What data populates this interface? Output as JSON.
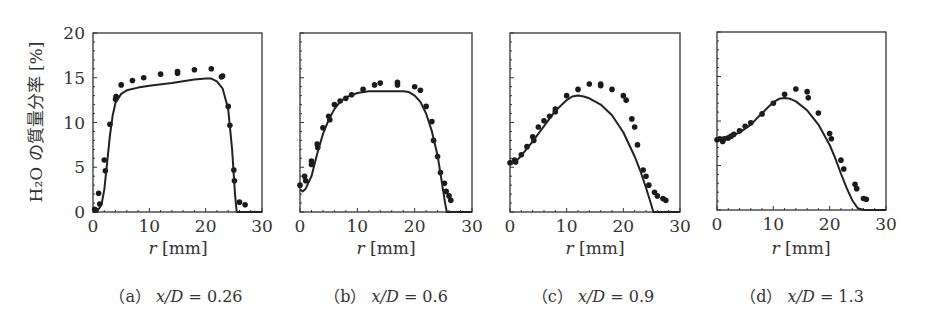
{
  "figure": {
    "ylabel": "H₂O の質量分率 [%]",
    "xlabel_var": "r",
    "xlabel_unit": "[mm]"
  },
  "chart_data": [
    {
      "type": "scatter+line",
      "panel": "(a)",
      "caption_prefix": "（a）",
      "caption_var": "x/D",
      "caption_value": "= 0.26",
      "xlabel": "r [mm]",
      "ylabel": "H2O の質量分率 [%]",
      "xlim": [
        0,
        30
      ],
      "ylim": [
        0,
        20
      ],
      "xticks": [
        0,
        10,
        20,
        30
      ],
      "yticks": [
        0,
        5,
        10,
        15,
        20
      ],
      "series": [
        {
          "name": "measured",
          "style": "markers",
          "points": [
            [
              0.3,
              0.3
            ],
            [
              0.5,
              0.2
            ],
            [
              1,
              2.1
            ],
            [
              1.2,
              0.9
            ],
            [
              2,
              5.8
            ],
            [
              2.2,
              4.6
            ],
            [
              3,
              9.8
            ],
            [
              4,
              12.6
            ],
            [
              4.1,
              12.9
            ],
            [
              5,
              14.2
            ],
            [
              7,
              14.7
            ],
            [
              9,
              15.0
            ],
            [
              12,
              15.4
            ],
            [
              15,
              15.7
            ],
            [
              15,
              15.5
            ],
            [
              18,
              15.9
            ],
            [
              21,
              16.0
            ],
            [
              23,
              15.2
            ],
            [
              22.8,
              15.1
            ],
            [
              24,
              11.8
            ],
            [
              24.3,
              9.7
            ],
            [
              25,
              4.7
            ],
            [
              25.1,
              3.5
            ],
            [
              26,
              1.1
            ],
            [
              27,
              0.8
            ]
          ]
        },
        {
          "name": "computed",
          "style": "line",
          "points": [
            [
              0,
              0
            ],
            [
              1,
              0.3
            ],
            [
              1.5,
              0.8
            ],
            [
              2,
              2.5
            ],
            [
              2.5,
              5.5
            ],
            [
              3,
              8.5
            ],
            [
              3.5,
              10.8
            ],
            [
              4,
              12.2
            ],
            [
              5,
              13.2
            ],
            [
              6,
              13.6
            ],
            [
              8,
              13.9
            ],
            [
              10,
              14.1
            ],
            [
              14,
              14.4
            ],
            [
              18,
              14.8
            ],
            [
              20,
              14.9
            ],
            [
              21,
              14.9
            ],
            [
              22,
              14.6
            ],
            [
              23,
              13.8
            ],
            [
              24,
              11.5
            ],
            [
              24.7,
              7
            ],
            [
              25.2,
              2
            ],
            [
              25.5,
              0
            ],
            [
              30,
              0
            ]
          ]
        }
      ]
    },
    {
      "type": "scatter+line",
      "panel": "(b)",
      "caption_prefix": "（b）",
      "caption_var": "x/D",
      "caption_value": "= 0.6",
      "xlabel": "r [mm]",
      "xlim": [
        0,
        30
      ],
      "ylim": [
        0,
        20
      ],
      "xticks": [
        0,
        10,
        20,
        30
      ],
      "series": [
        {
          "name": "measured",
          "style": "markers",
          "points": [
            [
              0,
              3
            ],
            [
              0.8,
              4
            ],
            [
              1,
              3.5
            ],
            [
              2,
              5.7
            ],
            [
              2,
              5.3
            ],
            [
              3,
              7.6
            ],
            [
              3.1,
              7.2
            ],
            [
              4,
              9.4
            ],
            [
              5,
              10.7
            ],
            [
              5.2,
              10.3
            ],
            [
              6,
              12.0
            ],
            [
              7,
              12.4
            ],
            [
              8,
              12.7
            ],
            [
              9,
              13.1
            ],
            [
              11,
              13.7
            ],
            [
              13,
              14.2
            ],
            [
              14,
              14.4
            ],
            [
              17,
              14.5
            ],
            [
              17,
              14.2
            ],
            [
              20,
              14.0
            ],
            [
              21,
              13.6
            ],
            [
              22,
              11.8
            ],
            [
              23,
              10.1
            ],
            [
              23.3,
              8.0
            ],
            [
              24,
              6.2
            ],
            [
              24.5,
              4.4
            ],
            [
              25.2,
              3.2
            ],
            [
              25.5,
              2.3
            ],
            [
              26,
              1.8
            ],
            [
              26.3,
              1.3
            ]
          ]
        },
        {
          "name": "computed",
          "style": "line",
          "points": [
            [
              0,
              2.5
            ],
            [
              0.5,
              2.3
            ],
            [
              1,
              2.6
            ],
            [
              2,
              4
            ],
            [
              3,
              6.5
            ],
            [
              4,
              8.7
            ],
            [
              5,
              10.3
            ],
            [
              6,
              11.5
            ],
            [
              7,
              12.3
            ],
            [
              8,
              12.8
            ],
            [
              10,
              13.3
            ],
            [
              12,
              13.5
            ],
            [
              18,
              13.5
            ],
            [
              19,
              13.4
            ],
            [
              20,
              13
            ],
            [
              21,
              12.3
            ],
            [
              22,
              11
            ],
            [
              23,
              9
            ],
            [
              24,
              6.3
            ],
            [
              24.7,
              3.5
            ],
            [
              25.3,
              1
            ],
            [
              25.6,
              0
            ],
            [
              30,
              0
            ]
          ]
        }
      ]
    },
    {
      "type": "scatter+line",
      "panel": "(c)",
      "caption_prefix": "（c）",
      "caption_var": "x/D",
      "caption_value": "= 0.9",
      "xlabel": "r [mm]",
      "xlim": [
        0,
        30
      ],
      "ylim": [
        0,
        20
      ],
      "xticks": [
        0,
        10,
        20,
        30
      ],
      "series": [
        {
          "name": "measured",
          "style": "markers",
          "points": [
            [
              0,
              5.5
            ],
            [
              0.8,
              5.8
            ],
            [
              1,
              5.6
            ],
            [
              2,
              6.4
            ],
            [
              3,
              7.3
            ],
            [
              4,
              8.4
            ],
            [
              4.2,
              8.0
            ],
            [
              5,
              9.5
            ],
            [
              6,
              10.2
            ],
            [
              7,
              10.7
            ],
            [
              8,
              11.5
            ],
            [
              8,
              11.2
            ],
            [
              10,
              13.0
            ],
            [
              12,
              13.7
            ],
            [
              14,
              14.3
            ],
            [
              16,
              14.3
            ],
            [
              16,
              14.1
            ],
            [
              18,
              13.7
            ],
            [
              20,
              13.0
            ],
            [
              20.5,
              12.5
            ],
            [
              21.5,
              10.4
            ],
            [
              22,
              9.5
            ],
            [
              22.5,
              7.5
            ],
            [
              23.5,
              4.7
            ],
            [
              24,
              4.0
            ],
            [
              24.5,
              3.0
            ],
            [
              25.5,
              2.2
            ],
            [
              26,
              1.8
            ],
            [
              27,
              1.5
            ],
            [
              27.5,
              1.3
            ]
          ]
        },
        {
          "name": "computed",
          "style": "line",
          "points": [
            [
              0,
              5.3
            ],
            [
              1,
              5.6
            ],
            [
              2,
              6.3
            ],
            [
              4,
              7.9
            ],
            [
              6,
              9.6
            ],
            [
              8,
              11.3
            ],
            [
              10,
              12.5
            ],
            [
              11,
              12.9
            ],
            [
              12,
              13.0
            ],
            [
              13,
              12.9
            ],
            [
              14,
              12.7
            ],
            [
              16,
              12.0
            ],
            [
              18,
              10.8
            ],
            [
              20,
              8.9
            ],
            [
              22,
              6.2
            ],
            [
              23,
              4.6
            ],
            [
              24,
              2.7
            ],
            [
              24.8,
              1.1
            ],
            [
              25.3,
              0
            ],
            [
              30,
              0
            ]
          ]
        }
      ]
    },
    {
      "type": "scatter+line",
      "panel": "(d)",
      "caption_prefix": "（d）",
      "caption_var": "x/D",
      "caption_value": "= 1.3",
      "xlabel": "r [mm]",
      "xlim": [
        0,
        30
      ],
      "ylim": [
        0,
        20
      ],
      "xticks": [
        0,
        10,
        20,
        30
      ],
      "series": [
        {
          "name": "measured",
          "style": "markers",
          "points": [
            [
              0,
              7.9
            ],
            [
              0.5,
              8.0
            ],
            [
              1,
              7.7
            ],
            [
              1.3,
              8.0
            ],
            [
              2,
              8.1
            ],
            [
              2.5,
              8.3
            ],
            [
              3,
              8.5
            ],
            [
              4,
              8.9
            ],
            [
              5,
              9.4
            ],
            [
              6,
              9.8
            ],
            [
              8,
              10.8
            ],
            [
              10,
              12.0
            ],
            [
              12,
              13.0
            ],
            [
              14,
              13.6
            ],
            [
              16,
              13.3
            ],
            [
              16.2,
              12.6
            ],
            [
              18,
              10.9
            ],
            [
              20,
              8.6
            ],
            [
              20.3,
              8.0
            ],
            [
              22,
              5.6
            ],
            [
              22.5,
              4.6
            ],
            [
              24.5,
              2.9
            ],
            [
              24.8,
              2.4
            ],
            [
              26,
              1.3
            ],
            [
              26.5,
              1.2
            ]
          ]
        },
        {
          "name": "computed",
          "style": "line",
          "points": [
            [
              0,
              8.0
            ],
            [
              2,
              8.2
            ],
            [
              4,
              8.7
            ],
            [
              6,
              9.6
            ],
            [
              8,
              10.9
            ],
            [
              10,
              12.1
            ],
            [
              11,
              12.5
            ],
            [
              12,
              12.6
            ],
            [
              13,
              12.5
            ],
            [
              14,
              12.2
            ],
            [
              16,
              11.2
            ],
            [
              18,
              9.6
            ],
            [
              20,
              7.3
            ],
            [
              21,
              5.8
            ],
            [
              22,
              4.1
            ],
            [
              23,
              2.5
            ],
            [
              24,
              1.1
            ],
            [
              25,
              0.2
            ],
            [
              26,
              0
            ],
            [
              30,
              0
            ]
          ]
        }
      ]
    }
  ],
  "panels_layout": [
    {
      "left": 93,
      "right": 262,
      "top": 33,
      "bottom": 212,
      "show_yticklabels": true
    },
    {
      "left": 300,
      "right": 472,
      "top": 33,
      "bottom": 212,
      "show_yticklabels": false
    },
    {
      "left": 510,
      "right": 680,
      "top": 33,
      "bottom": 212,
      "show_yticklabels": false
    },
    {
      "left": 717,
      "right": 886,
      "top": 32,
      "bottom": 210,
      "show_yticklabels": false
    }
  ]
}
